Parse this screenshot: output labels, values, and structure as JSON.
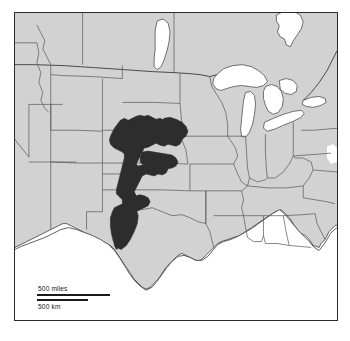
{
  "figure": {
    "kind": "thematic-map",
    "title": "",
    "region_depicted": "Central and eastern United States",
    "background_color": "#ffffff"
  },
  "map": {
    "frame": {
      "border_color": "#2b2b2b",
      "fill_color": "#ffffff"
    },
    "land_fill_color": "#d2d2d2",
    "land_outline_color": "#3a3a3a",
    "state_border_color": "#555555",
    "water_fill_color": "#ffffff",
    "highlight": {
      "name": "high-plains-aquifer-extent",
      "fill_color": "#2d2d2d",
      "outline_color": "#2d2d2d"
    }
  },
  "scale_bar": {
    "miles_label": "500 miles",
    "km_label": "500 km",
    "miles_value": 500,
    "miles_unit": "miles",
    "km_value": 500,
    "km_unit": "km",
    "bar_color": "#1a1a1a"
  }
}
